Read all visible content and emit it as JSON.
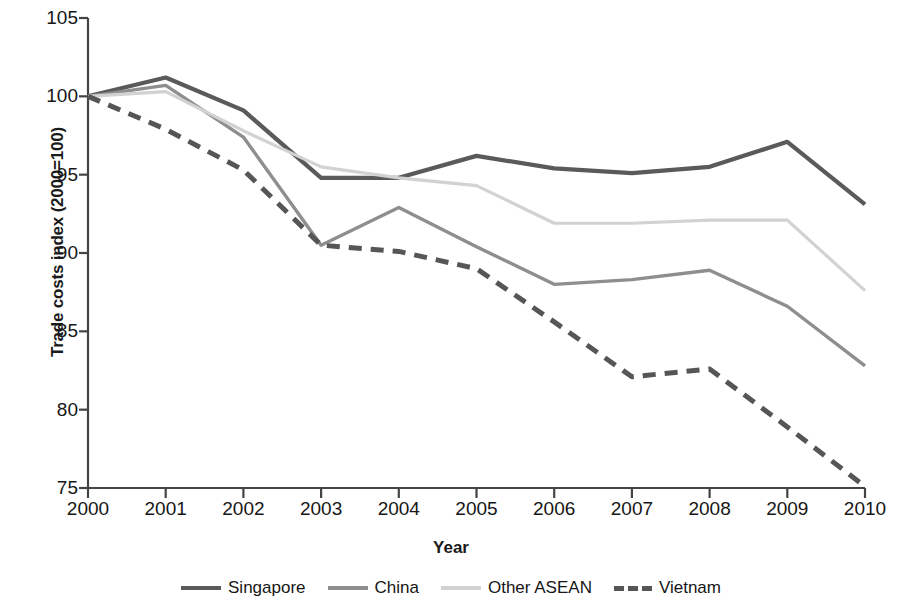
{
  "chart_data": {
    "type": "line",
    "title": "",
    "xlabel": "Year",
    "ylabel": "Trade costs index (2000=100)",
    "x": [
      2000,
      2001,
      2002,
      2003,
      2004,
      2005,
      2006,
      2007,
      2008,
      2009,
      2010
    ],
    "xtick_labels": [
      "2000",
      "2001",
      "2002",
      "2003",
      "2004",
      "2005",
      "2006",
      "2007",
      "2008",
      "2009",
      "2010"
    ],
    "ytick_labels": [
      "75",
      "80",
      "85",
      "90",
      "95",
      "100",
      "105"
    ],
    "yticks": [
      75,
      80,
      85,
      90,
      95,
      100,
      105
    ],
    "xlim": [
      2000,
      2010
    ],
    "ylim": [
      75,
      105
    ],
    "grid": false,
    "legend_position": "bottom",
    "series": [
      {
        "name": "Singapore",
        "color": "#5a5a5a",
        "style": "solid",
        "width": 4.2,
        "values": [
          100.0,
          101.2,
          99.1,
          94.8,
          94.8,
          96.2,
          95.4,
          95.1,
          95.5,
          97.1,
          93.1
        ]
      },
      {
        "name": "China",
        "color": "#8e8e8e",
        "style": "solid",
        "width": 3.4,
        "values": [
          100.0,
          100.7,
          97.4,
          90.5,
          92.9,
          90.4,
          88.0,
          88.3,
          88.9,
          86.6,
          82.8
        ]
      },
      {
        "name": "Other ASEAN",
        "color": "#d2d2d2",
        "style": "solid",
        "width": 3.2,
        "values": [
          100.0,
          100.3,
          97.8,
          95.5,
          94.8,
          94.3,
          91.9,
          91.9,
          92.1,
          92.1,
          87.6
        ]
      },
      {
        "name": "Vietnam",
        "color": "#565656",
        "style": "dashed",
        "width": 5.0,
        "values": [
          100.0,
          97.9,
          95.3,
          90.5,
          90.1,
          89.0,
          85.6,
          82.1,
          82.6,
          78.9,
          75.1
        ]
      }
    ]
  },
  "axis": {
    "y_title": "Trade costs index (2000=100)",
    "x_title": "Year"
  },
  "legend": {
    "items": [
      {
        "label": "Singapore"
      },
      {
        "label": "China"
      },
      {
        "label": "Other ASEAN"
      },
      {
        "label": "Vietnam"
      }
    ]
  }
}
